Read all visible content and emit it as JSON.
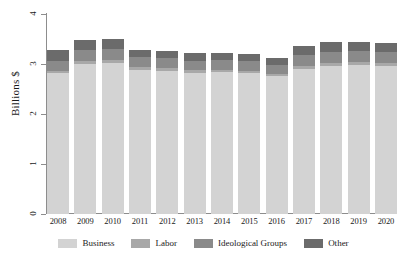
{
  "chart_data": {
    "type": "bar",
    "stacked": true,
    "title": "",
    "xlabel": "",
    "ylabel": "Billions $",
    "ylim": [
      0,
      4
    ],
    "ytick_labels": [
      "4",
      "3",
      "2",
      "1",
      "0"
    ],
    "ytick_values": [
      4,
      3,
      2,
      1,
      0
    ],
    "grid": false,
    "legend_position": "bottom",
    "categories": [
      "2008",
      "2009",
      "2010",
      "2011",
      "2012",
      "2013",
      "2014",
      "2015",
      "2016",
      "2017",
      "2018",
      "2019",
      "2020"
    ],
    "series": [
      {
        "name": "Business",
        "color": "#d3d3d3",
        "values": [
          2.82,
          3.0,
          3.02,
          2.89,
          2.87,
          2.83,
          2.84,
          2.82,
          2.76,
          2.91,
          2.97,
          2.98,
          2.96
        ]
      },
      {
        "name": "Labor",
        "color": "#a8a8a8",
        "values": [
          0.05,
          0.06,
          0.06,
          0.05,
          0.05,
          0.05,
          0.05,
          0.05,
          0.05,
          0.06,
          0.06,
          0.06,
          0.06
        ]
      },
      {
        "name": "Ideological Groups",
        "color": "#8a8a8a",
        "values": [
          0.19,
          0.22,
          0.22,
          0.2,
          0.2,
          0.19,
          0.19,
          0.19,
          0.18,
          0.21,
          0.22,
          0.22,
          0.22
        ]
      },
      {
        "name": "Other",
        "color": "#6b6b6b",
        "values": [
          0.23,
          0.21,
          0.2,
          0.15,
          0.15,
          0.15,
          0.15,
          0.14,
          0.14,
          0.18,
          0.19,
          0.19,
          0.19
        ]
      }
    ],
    "totals": [
      3.29,
      3.49,
      3.5,
      3.29,
      3.27,
      3.22,
      3.23,
      3.2,
      3.13,
      3.36,
      3.44,
      3.45,
      3.43
    ]
  },
  "legend": {
    "items": [
      {
        "label": "Business",
        "color": "#d3d3d3"
      },
      {
        "label": "Labor",
        "color": "#a8a8a8"
      },
      {
        "label": "Ideological Groups",
        "color": "#8a8a8a"
      },
      {
        "label": "Other",
        "color": "#6b6b6b"
      }
    ]
  },
  "axes": {
    "y_title": "Billions $"
  }
}
